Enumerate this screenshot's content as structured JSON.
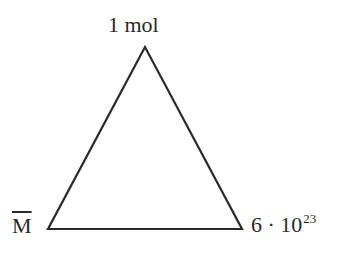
{
  "diagram": {
    "type": "triangle",
    "vertices": {
      "top": {
        "label": "1 mol",
        "x": 145,
        "y": 47
      },
      "bottom_left": {
        "label": "M",
        "overline": true,
        "x": 48,
        "y": 229
      },
      "bottom_right": {
        "label_base": "6 · 10",
        "label_exponent": "23",
        "x": 242,
        "y": 229
      }
    },
    "stroke_color": "#2a2a2a",
    "background": "#ffffff"
  }
}
